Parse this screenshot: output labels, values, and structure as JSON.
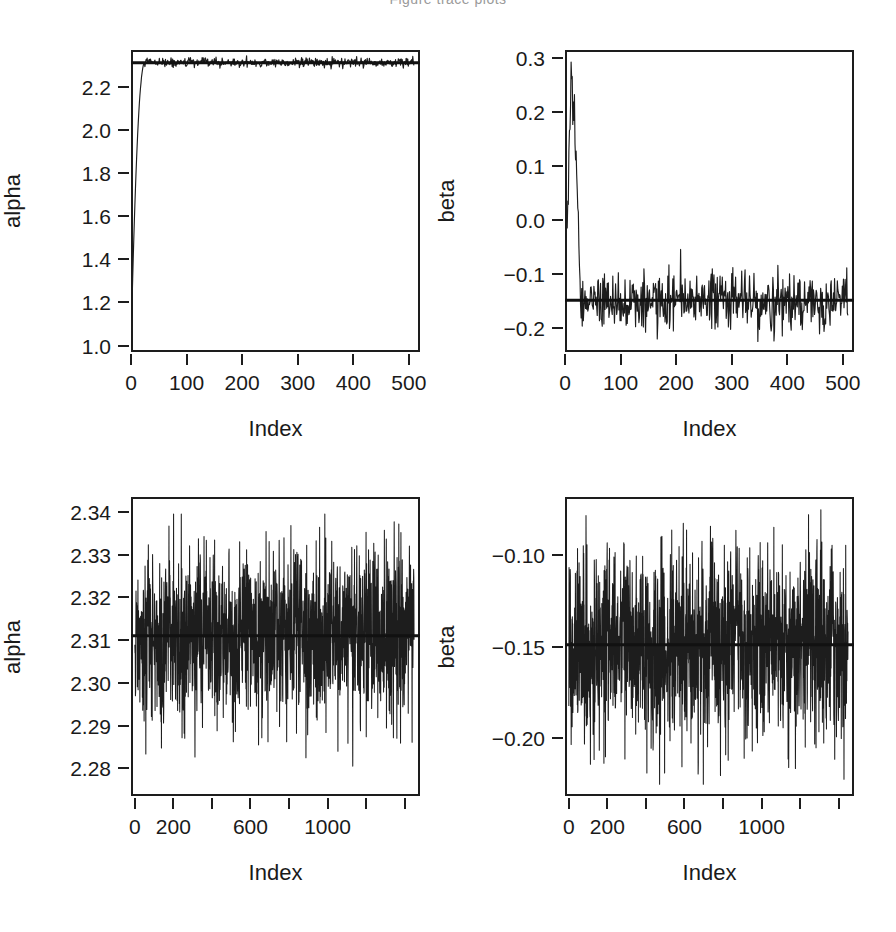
{
  "figure": {
    "background": "#ffffff",
    "ink_color": "#1d1d1d",
    "header_fragment": "Figure  trace plots"
  },
  "chart_data": [
    {
      "id": "alpha-burnin",
      "type": "line",
      "title": "",
      "xlabel": "Index",
      "ylabel": "alpha",
      "xlim": [
        0,
        520
      ],
      "ylim": [
        0.97,
        2.37
      ],
      "xticks": [
        0,
        100,
        200,
        300,
        400,
        500
      ],
      "xtick_labels": [
        "0",
        "100",
        "200",
        "300",
        "400",
        "500"
      ],
      "yticks": [
        1.0,
        1.2,
        1.4,
        1.6,
        1.8,
        2.0,
        2.2
      ],
      "ytick_labels": [
        "1.0",
        "1.2",
        "1.4",
        "1.6",
        "1.8",
        "2.0",
        "2.2"
      ],
      "grid": false,
      "legend": "none",
      "reference_line": {
        "orientation": "horizontal",
        "value": 2.311,
        "color": "#111111",
        "width": 3
      },
      "description": "MCMC chain for alpha including burn-in: rises steeply from 1.0 to about 2.31 within the first 25 iterations, then fluctuates narrowly around 2.31.",
      "n_points": 510,
      "burnin_start_value": 1.0,
      "converged_mean": 2.311,
      "converged_sd": 0.011,
      "burnin_length": 25,
      "series": [
        {
          "name": "alpha",
          "x": [
            0,
            2,
            4,
            6,
            8,
            10,
            12,
            14,
            16,
            18,
            20,
            22,
            25,
            30,
            40,
            60,
            100,
            200,
            300,
            400,
            500
          ],
          "values": [
            1.0,
            1.12,
            1.34,
            1.58,
            1.79,
            1.97,
            2.1,
            2.19,
            2.25,
            2.28,
            2.3,
            2.305,
            2.31,
            2.312,
            2.309,
            2.313,
            2.31,
            2.312,
            2.308,
            2.314,
            2.311
          ]
        }
      ]
    },
    {
      "id": "beta-burnin",
      "type": "line",
      "title": "",
      "xlabel": "Index",
      "ylabel": "beta",
      "xlim": [
        0,
        520
      ],
      "ylim": [
        -0.245,
        0.315
      ],
      "xticks": [
        0,
        100,
        200,
        300,
        400,
        500
      ],
      "xtick_labels": [
        "0",
        "100",
        "200",
        "300",
        "400",
        "500"
      ],
      "yticks": [
        -0.2,
        -0.1,
        0.0,
        0.1,
        0.2,
        0.3
      ],
      "ytick_labels": [
        "−0.2",
        "−0.1",
        "0.0",
        "0.1",
        "0.2",
        "0.3"
      ],
      "grid": false,
      "legend": "none",
      "reference_line": {
        "orientation": "horizontal",
        "value": -0.149,
        "color": "#111111",
        "width": 3
      },
      "description": "MCMC chain for beta including burn-in: starts near -0.05, spikes up to about 0.28 around iteration 12, then drops and settles into noise around -0.15.",
      "n_points": 510,
      "burnin_peak_value": 0.283,
      "converged_mean": -0.149,
      "converged_sd": 0.027,
      "burnin_length": 28,
      "series": [
        {
          "name": "beta",
          "x": [
            0,
            2,
            4,
            6,
            8,
            10,
            12,
            14,
            16,
            18,
            20,
            22,
            24,
            26,
            28,
            40,
            100,
            200,
            300,
            400,
            500
          ],
          "values": [
            -0.05,
            0.0,
            -0.06,
            0.05,
            0.14,
            0.21,
            0.283,
            0.2,
            0.12,
            0.08,
            0.04,
            -0.02,
            -0.09,
            -0.13,
            -0.15,
            -0.148,
            -0.152,
            -0.145,
            -0.16,
            -0.142,
            -0.15
          ]
        }
      ]
    },
    {
      "id": "alpha-posterior",
      "type": "line",
      "title": "",
      "xlabel": "Index",
      "ylabel": "alpha",
      "xlim": [
        -20,
        1480
      ],
      "ylim": [
        2.2735,
        2.3435
      ],
      "xticks": [
        0,
        200,
        400,
        600,
        800,
        1000,
        1200,
        1400
      ],
      "xtick_labels": [
        "0",
        "200",
        "",
        "600",
        "",
        "1000",
        "",
        ""
      ],
      "yticks": [
        2.28,
        2.29,
        2.3,
        2.31,
        2.32,
        2.33,
        2.34
      ],
      "ytick_labels": [
        "2.28",
        "2.29",
        "2.30",
        "2.31",
        "2.32",
        "2.33",
        "2.34"
      ],
      "grid": false,
      "legend": "none",
      "reference_line": {
        "orientation": "horizontal",
        "value": 2.311,
        "color": "#111111",
        "width": 3
      },
      "description": "Post burn-in MCMC trace for alpha: dense stationary noise centred on 2.311, spanning roughly 2.279 to 2.340.",
      "n_points": 1450,
      "mean": 2.311,
      "sd": 0.0105,
      "min": 2.2785,
      "max": 2.3395
    },
    {
      "id": "beta-posterior",
      "type": "line",
      "title": "",
      "xlabel": "Index",
      "ylabel": "beta",
      "xlim": [
        -20,
        1480
      ],
      "ylim": [
        -0.232,
        -0.068
      ],
      "xticks": [
        0,
        200,
        400,
        600,
        800,
        1000,
        1200,
        1400
      ],
      "xtick_labels": [
        "0",
        "200",
        "",
        "600",
        "",
        "1000",
        "",
        ""
      ],
      "yticks": [
        -0.2,
        -0.15,
        -0.1
      ],
      "ytick_labels": [
        "−0.20",
        "−0.15",
        "−0.10"
      ],
      "grid": false,
      "legend": "none",
      "reference_line": {
        "orientation": "horizontal",
        "value": -0.149,
        "color": "#111111",
        "width": 3
      },
      "description": "Post burn-in MCMC trace for beta: dense stationary noise centred on -0.149, spanning roughly -0.225 to -0.073.",
      "n_points": 1450,
      "mean": -0.149,
      "sd": 0.0255,
      "min": -0.2255,
      "max": -0.0735
    }
  ]
}
